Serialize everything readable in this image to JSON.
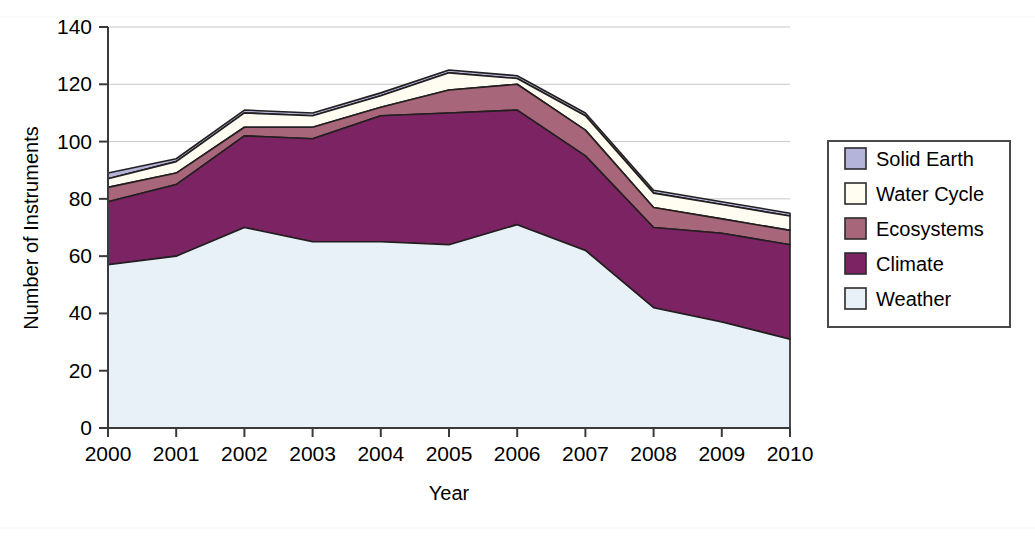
{
  "chart_data": {
    "type": "area",
    "stacked": true,
    "title": "",
    "xlabel": "Year",
    "ylabel": "Number of Instruments",
    "categories": [
      2000,
      2001,
      2002,
      2003,
      2004,
      2005,
      2006,
      2007,
      2008,
      2009,
      2010
    ],
    "x_tick_labels": [
      "2000",
      "2001",
      "2002",
      "2003",
      "2004",
      "2005",
      "2006",
      "2007",
      "2008",
      "2009",
      "2010"
    ],
    "y_tick_labels": [
      "0",
      "20",
      "40",
      "60",
      "80",
      "100",
      "120",
      "140"
    ],
    "y_ticks": [
      0,
      20,
      40,
      60,
      80,
      100,
      120,
      140
    ],
    "ylim": [
      0,
      140
    ],
    "xlim": [
      2000,
      2010
    ],
    "grid": "horizontal",
    "legend_position": "right",
    "stack_order_bottom_to_top": [
      "Weather",
      "Climate",
      "Ecosystems",
      "Water Cycle",
      "Solid Earth"
    ],
    "series": [
      {
        "name": "Weather",
        "color": "#e7f1f7",
        "values": [
          57,
          60,
          70,
          65,
          65,
          64,
          71,
          62,
          42,
          37,
          31
        ]
      },
      {
        "name": "Climate",
        "color": "#7b2363",
        "values": [
          22,
          25,
          32,
          36,
          44,
          46,
          40,
          33,
          28,
          31,
          33
        ]
      },
      {
        "name": "Ecosystems",
        "color": "#a8667a",
        "values": [
          5,
          4,
          3,
          4,
          3,
          8,
          9,
          9,
          7,
          5,
          5
        ]
      },
      {
        "name": "Water Cycle",
        "color": "#fffdf2",
        "values": [
          3,
          4,
          5,
          4,
          4,
          6,
          2,
          5,
          5,
          5,
          5
        ]
      },
      {
        "name": "Solid Earth",
        "color": "#b4b4da",
        "values": [
          2,
          1,
          1,
          1,
          1,
          1,
          1,
          1,
          1,
          1,
          1
        ]
      }
    ],
    "totals": [
      89,
      94,
      111,
      110,
      117,
      125,
      123,
      110,
      83,
      79,
      75
    ],
    "cumulative_tops": {
      "Weather": [
        57,
        60,
        70,
        65,
        65,
        64,
        71,
        62,
        42,
        37,
        31
      ],
      "Climate": [
        79,
        85,
        102,
        101,
        109,
        110,
        111,
        95,
        70,
        68,
        64
      ],
      "Ecosystems": [
        84,
        89,
        105,
        105,
        112,
        118,
        120,
        104,
        77,
        73,
        69
      ],
      "Water Cycle": [
        87,
        93,
        110,
        109,
        116,
        124,
        122,
        109,
        82,
        78,
        74
      ],
      "Solid Earth": [
        89,
        94,
        111,
        110,
        117,
        125,
        123,
        110,
        83,
        79,
        75
      ]
    }
  },
  "legend": {
    "items": [
      {
        "label": "Solid Earth",
        "color": "#b4b4da"
      },
      {
        "label": "Water Cycle",
        "color": "#fffdf2"
      },
      {
        "label": "Ecosystems",
        "color": "#a8667a"
      },
      {
        "label": "Climate",
        "color": "#7b2363"
      },
      {
        "label": "Weather",
        "color": "#e7f1f7"
      }
    ]
  },
  "axes": {
    "y_title": "Number of Instruments",
    "x_title": "Year"
  },
  "style": {
    "outline_color": "#231f20",
    "grid_color": "#c8c8c8",
    "axis_color": "#3a3a3a",
    "legend_border": "#4a4a4a"
  }
}
